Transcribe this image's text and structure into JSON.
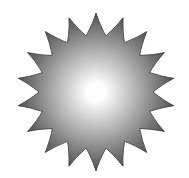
{
  "image": {
    "width": 189,
    "height": 178,
    "background": "#ffffff"
  },
  "sun": {
    "icon": "sun-icon",
    "center": [
      96,
      92
    ],
    "ray_count": 18,
    "outer_radius": 79,
    "inner_radius": 57,
    "rotation_deg": -90,
    "curl": 0.22,
    "gradient": {
      "center_color": "#ffffff",
      "mid_color": "#bdbdbd",
      "edge_color": "#4a4a4a",
      "outline_color": "#3a3a3a"
    }
  }
}
